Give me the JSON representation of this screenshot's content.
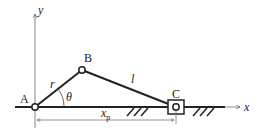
{
  "diagram": {
    "type": "slider-crank mechanism",
    "points": {
      "A": {
        "label": "A"
      },
      "B": {
        "label": "B"
      },
      "C": {
        "label": "C"
      }
    },
    "axes": {
      "x_label": "x",
      "y_label": "y"
    },
    "links": {
      "crank_label": "r",
      "rod_label": "l"
    },
    "angle_label": "θ",
    "dimension": {
      "label": "x",
      "subscript": "p"
    },
    "colors": {
      "line": "#222222",
      "thin": "#555555"
    }
  }
}
